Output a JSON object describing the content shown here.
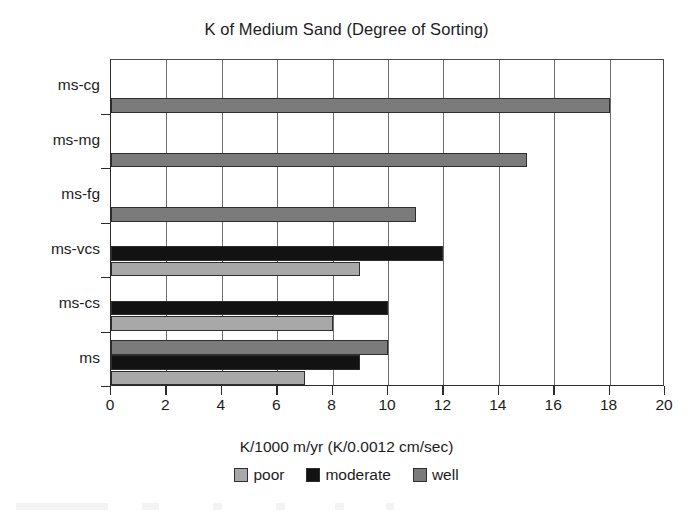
{
  "chart_data": {
    "type": "bar",
    "orientation": "horizontal",
    "title": "K of Medium Sand (Degree of Sorting)",
    "xlabel": "K/1000 m/yr (K/0.0012 cm/sec)",
    "ylabel": "",
    "xlim": [
      0,
      20
    ],
    "xticks": [
      0,
      2,
      4,
      6,
      8,
      10,
      12,
      14,
      16,
      18,
      20
    ],
    "xtick_labels": [
      "0",
      "2",
      "4",
      "6",
      "8",
      "10",
      "12",
      "14",
      "16",
      "18",
      "20"
    ],
    "categories": [
      "ms",
      "ms-cs",
      "ms-vcs",
      "ms-fg",
      "ms-mg",
      "ms-cg"
    ],
    "categories_top_to_bottom": [
      "ms-cg",
      "ms-mg",
      "ms-fg",
      "ms-vcs",
      "ms-cs",
      "ms"
    ],
    "grid": "vertical",
    "legend_position": "bottom",
    "series": [
      {
        "name": "poor",
        "color": "#a8a8a8",
        "values": [
          7,
          8,
          9,
          null,
          null,
          null
        ]
      },
      {
        "name": "moderate",
        "color": "#121212",
        "values": [
          9,
          10,
          12,
          null,
          null,
          null
        ]
      },
      {
        "name": "well",
        "color": "#7b7b7b",
        "values": [
          10,
          null,
          null,
          11,
          15,
          18
        ]
      }
    ],
    "bars_top_to_bottom": [
      {
        "category": "ms-cg",
        "series": "well",
        "value": 18
      },
      {
        "category": "ms-mg",
        "series": "well",
        "value": 15
      },
      {
        "category": "ms-fg",
        "series": "well",
        "value": 11
      },
      {
        "category": "ms-vcs",
        "series": "moderate",
        "value": 12
      },
      {
        "category": "ms-vcs",
        "series": "poor",
        "value": 9
      },
      {
        "category": "ms-cs",
        "series": "moderate",
        "value": 10
      },
      {
        "category": "ms-cs",
        "series": "poor",
        "value": 8
      },
      {
        "category": "ms",
        "series": "well",
        "value": 10
      },
      {
        "category": "ms",
        "series": "moderate",
        "value": 9
      },
      {
        "category": "ms",
        "series": "poor",
        "value": 7
      }
    ]
  },
  "legend": {
    "entries": [
      {
        "label": "poor",
        "color": "#a8a8a8"
      },
      {
        "label": "moderate",
        "color": "#121212"
      },
      {
        "label": "well",
        "color": "#7b7b7b"
      }
    ]
  },
  "colors": {
    "poor": "#a8a8a8",
    "moderate": "#121212",
    "well": "#7b7b7b",
    "axis": "#2b2b2b",
    "grid": "#6d6d6d",
    "text": "#1c1c1c",
    "background": "#ffffff"
  }
}
